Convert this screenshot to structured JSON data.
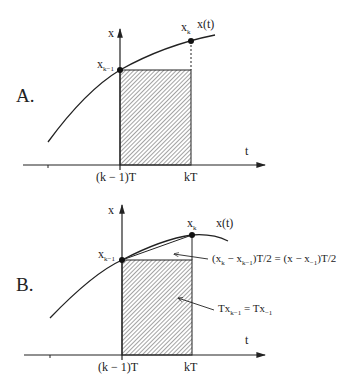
{
  "panels": [
    {
      "id": "A",
      "label": "A.",
      "y_axis_label": "x",
      "t_axis_label": "t",
      "curve_label": "x(t)",
      "point_prev": {
        "base": "x",
        "sub": "k−1"
      },
      "point_cur": {
        "base": "x",
        "sub": "k"
      },
      "tick_prev": "(k − 1)T",
      "tick_cur": "kT"
    },
    {
      "id": "B",
      "label": "B.",
      "y_axis_label": "x",
      "t_axis_label": "t",
      "curve_label": "x(t)",
      "point_prev": {
        "base": "x",
        "sub": "k−1"
      },
      "point_cur": {
        "base": "x",
        "sub": "k"
      },
      "tick_prev": "(k − 1)T",
      "tick_cur": "kT",
      "annotations": {
        "triangle": {
          "pre": "(x",
          "s1": "k",
          "mid": " − x",
          "s2": "k−1",
          "mid2": ")T/2 = (x − x",
          "s3": "−1",
          "post": ")T/2"
        },
        "rectangle": {
          "pre": "Tx",
          "s1": "k−1",
          "mid": " = Tx",
          "s2": "−1"
        }
      }
    }
  ]
}
